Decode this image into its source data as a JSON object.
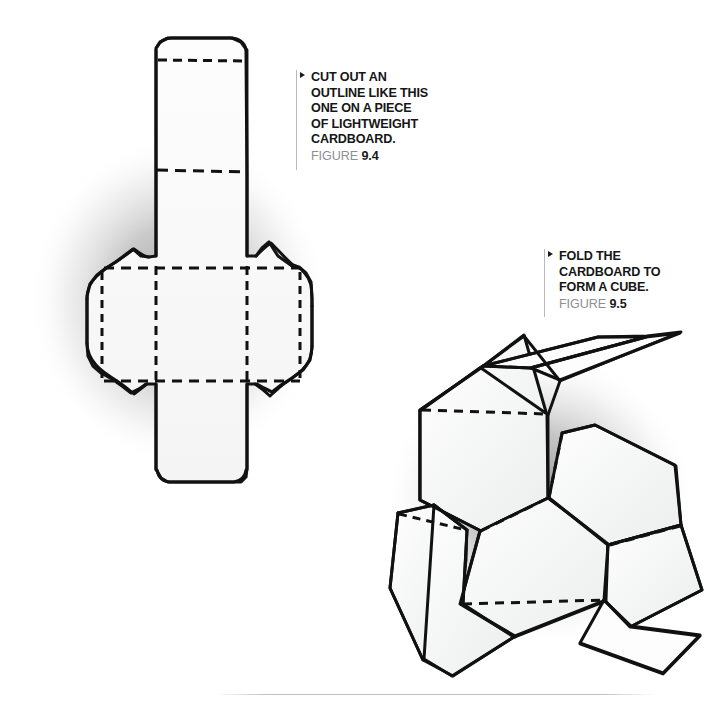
{
  "page": {
    "width": 719,
    "height": 707,
    "background": "#ffffff",
    "ink_color": "#161616",
    "paper_fill": "#fbfbfb",
    "shadow_color": "#9a9a9a",
    "rule_color": "#b9b9bb",
    "caption_gray": "#8e8e92"
  },
  "figures": [
    {
      "id": "figure-9-4",
      "marker": "triangle-right-marker",
      "lines": [
        "CUT OUT AN",
        "OUTLINE LIKE THIS",
        "ONE ON A PIECE",
        "OF LIGHTWEIGHT",
        "CARDBOARD."
      ],
      "figure_label": "FIGURE",
      "figure_number": "9.4",
      "illustration": "cube-net-flat-cross-with-glue-flaps"
    },
    {
      "id": "figure-9-5",
      "marker": "triangle-right-marker",
      "lines": [
        "FOLD THE",
        "CARDBOARD TO",
        "FORM A CUBE."
      ],
      "figure_label": "FIGURE",
      "figure_number": "9.5",
      "illustration": "cardboard-partially-folded-into-cube"
    }
  ]
}
